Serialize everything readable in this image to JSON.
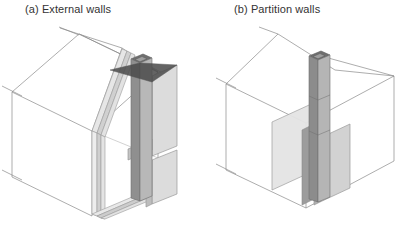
{
  "figure": {
    "background_color": "#ffffff",
    "line_color": "#8a8a8a",
    "caption_color": "#333333",
    "panels": [
      {
        "id": "a",
        "caption": "(a) External walls",
        "view": "axonometric",
        "building": {
          "form": "single-storey house with gable roof",
          "wireframe": true
        },
        "highlighted_elements": [
          "external wall panels along perimeter",
          "gable end wall panel",
          "roof-level wall band",
          "floor-level wall band",
          "square hollow section column",
          "horizontal panel splice joint"
        ],
        "colors": {
          "panel_face": "#d9d9d9",
          "panel_face_light": "#e6e6e6",
          "panel_edge": "#9a9a9a",
          "column_front": "#8f8f8f",
          "column_side": "#bdbdbd",
          "column_top": "#6f6f6f"
        }
      },
      {
        "id": "b",
        "caption": "(b) Partition walls",
        "view": "axonometric",
        "building": {
          "form": "single-storey house with gable roof",
          "wireframe": true
        },
        "highlighted_elements": [
          "interior partition wall panel",
          "cross partition wall panel",
          "square hollow section column",
          "column-to-partition connection"
        ],
        "colors": {
          "panel_face": "#d0d0d0",
          "panel_face_light": "#e2e2e2",
          "panel_edge": "#9a9a9a",
          "column_front": "#8f8f8f",
          "column_side": "#b5b5b5",
          "column_top": "#6f6f6f"
        }
      }
    ]
  }
}
